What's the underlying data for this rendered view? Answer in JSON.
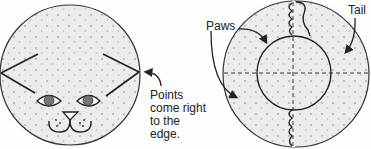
{
  "figure_left": {
    "name": "cat-face-circle",
    "annotation_lines": [
      "Points",
      "come right",
      "to the",
      "edge."
    ]
  },
  "figure_right": {
    "name": "cat-body-circle",
    "labels": {
      "paws": "Paws",
      "tail": "Tail"
    }
  },
  "colors": {
    "fill": "#e9e9e9",
    "stroke": "#2a2a2a",
    "dots": "#b8b8b8"
  }
}
